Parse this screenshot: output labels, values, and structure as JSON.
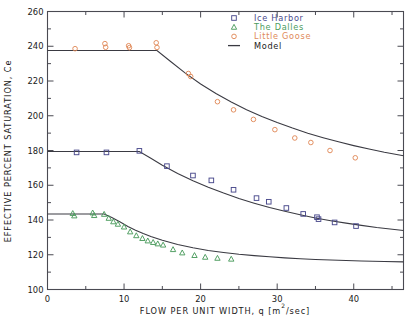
{
  "chart_data": {
    "type": "scatter",
    "title": "",
    "xlabel": "FLOW PER UNIT WIDTH, q [m2/sec]",
    "xlabel_parts": {
      "main": "FLOW PER UNIT WIDTH, q [m",
      "sup": "2",
      "tail": "/sec]"
    },
    "ylabel": "EFFECTIVE PERCENT SATURATION, Ce",
    "xlim": [
      0,
      46.5
    ],
    "ylim": [
      100,
      260
    ],
    "xticks": [
      0,
      10,
      20,
      30,
      40
    ],
    "yticks": [
      100,
      120,
      140,
      160,
      180,
      200,
      220,
      240,
      260
    ],
    "x_minor_interval": 5,
    "y_minor_interval": 10,
    "grid": false,
    "legend_position": "top-right",
    "legend": [
      {
        "label": "Ice Harbor",
        "marker": "square",
        "color": "#4a4a8c"
      },
      {
        "label": "The Dalles",
        "marker": "triangle",
        "color": "#4c9c5e"
      },
      {
        "label": "Little Goose",
        "marker": "circle",
        "color": "#e08a5a"
      },
      {
        "label": "Model",
        "marker": "line",
        "color": "#3a3a42"
      }
    ],
    "series": [
      {
        "name": "Little Goose",
        "marker": "circle",
        "color": "#e08a5a",
        "points": [
          [
            3.6,
            238.6
          ],
          [
            7.5,
            241.5
          ],
          [
            7.6,
            239.4
          ],
          [
            10.6,
            240.3
          ],
          [
            10.7,
            239.2
          ],
          [
            14.2,
            242.0
          ],
          [
            14.3,
            239.3
          ],
          [
            18.4,
            224.3
          ],
          [
            18.7,
            222.6
          ],
          [
            22.2,
            208.1
          ],
          [
            24.3,
            203.4
          ],
          [
            26.9,
            197.9
          ],
          [
            29.7,
            192.0
          ],
          [
            32.3,
            187.2
          ],
          [
            34.4,
            184.6
          ],
          [
            36.9,
            180.0
          ],
          [
            40.2,
            175.8
          ]
        ]
      },
      {
        "name": "Ice Harbor",
        "marker": "square",
        "color": "#4a4a8c",
        "points": [
          [
            3.8,
            178.9
          ],
          [
            7.7,
            178.9
          ],
          [
            12.0,
            179.8
          ],
          [
            15.6,
            171.0
          ],
          [
            19.0,
            165.6
          ],
          [
            21.4,
            162.8
          ],
          [
            24.3,
            157.4
          ],
          [
            27.3,
            152.6
          ],
          [
            28.9,
            150.5
          ],
          [
            31.2,
            146.9
          ],
          [
            33.4,
            143.5
          ],
          [
            35.2,
            141.6
          ],
          [
            35.4,
            140.5
          ],
          [
            37.5,
            138.6
          ],
          [
            40.3,
            136.5
          ]
        ]
      },
      {
        "name": "The Dalles",
        "marker": "triangle",
        "color": "#4c9c5e",
        "points": [
          [
            3.3,
            143.8
          ],
          [
            3.5,
            142.4
          ],
          [
            5.9,
            144.1
          ],
          [
            6.1,
            142.6
          ],
          [
            7.4,
            143.3
          ],
          [
            8.0,
            141.0
          ],
          [
            8.6,
            139.0
          ],
          [
            9.2,
            137.6
          ],
          [
            10.0,
            136.0
          ],
          [
            10.8,
            133.2
          ],
          [
            11.6,
            131.0
          ],
          [
            12.4,
            129.4
          ],
          [
            13.1,
            128.0
          ],
          [
            13.8,
            127.1
          ],
          [
            14.4,
            126.3
          ],
          [
            15.1,
            125.6
          ],
          [
            16.4,
            123.0
          ],
          [
            17.6,
            121.1
          ],
          [
            19.2,
            119.6
          ],
          [
            20.6,
            118.6
          ],
          [
            22.2,
            118.0
          ],
          [
            24.0,
            117.5
          ]
        ]
      }
    ],
    "model_curves": [
      {
        "name": "Little Goose Model",
        "plateau_value": 237.5,
        "breakpoint_x": 14.3,
        "points": [
          [
            0,
            237.5
          ],
          [
            14.3,
            237.5
          ],
          [
            16,
            231.5
          ],
          [
            18,
            224.5
          ],
          [
            20,
            218.3
          ],
          [
            22,
            212.8
          ],
          [
            24,
            207.9
          ],
          [
            26,
            203.5
          ],
          [
            28,
            199.6
          ],
          [
            30,
            196.1
          ],
          [
            32,
            192.9
          ],
          [
            34,
            190.0
          ],
          [
            36,
            187.4
          ],
          [
            38,
            185.0
          ],
          [
            40,
            182.8
          ],
          [
            42,
            180.8
          ],
          [
            44,
            179.0
          ],
          [
            46.5,
            177.0
          ]
        ]
      },
      {
        "name": "Ice Harbor Model",
        "plateau_value": 179.4,
        "breakpoint_x": 12.0,
        "points": [
          [
            0,
            179.4
          ],
          [
            12.0,
            179.4
          ],
          [
            13.5,
            175.5
          ],
          [
            15,
            171.5
          ],
          [
            17,
            166.8
          ],
          [
            19,
            162.6
          ],
          [
            21,
            158.9
          ],
          [
            23,
            155.5
          ],
          [
            25,
            152.4
          ],
          [
            27,
            149.7
          ],
          [
            29,
            147.2
          ],
          [
            31,
            145.0
          ],
          [
            33,
            143.0
          ],
          [
            35,
            141.2
          ],
          [
            37,
            139.6
          ],
          [
            39,
            138.2
          ],
          [
            41,
            136.9
          ],
          [
            43,
            135.7
          ],
          [
            46.5,
            134.0
          ]
        ]
      },
      {
        "name": "The Dalles Model",
        "plateau_value": 143.5,
        "breakpoint_x": 7.4,
        "points": [
          [
            0,
            143.5
          ],
          [
            7.4,
            143.5
          ],
          [
            8.4,
            141.4
          ],
          [
            9.5,
            138.8
          ],
          [
            10.5,
            136.3
          ],
          [
            11.5,
            134.1
          ],
          [
            12.5,
            132.2
          ],
          [
            13.5,
            130.5
          ],
          [
            15,
            128.3
          ],
          [
            17,
            125.9
          ],
          [
            19,
            124.0
          ],
          [
            21,
            122.5
          ],
          [
            23,
            121.3
          ],
          [
            25,
            120.3
          ],
          [
            27,
            119.5
          ],
          [
            29,
            118.8
          ],
          [
            31,
            118.2
          ],
          [
            33,
            117.7
          ],
          [
            35,
            117.3
          ],
          [
            38,
            116.8
          ],
          [
            41,
            116.4
          ],
          [
            44,
            116.1
          ],
          [
            46.5,
            115.9
          ]
        ]
      }
    ]
  }
}
